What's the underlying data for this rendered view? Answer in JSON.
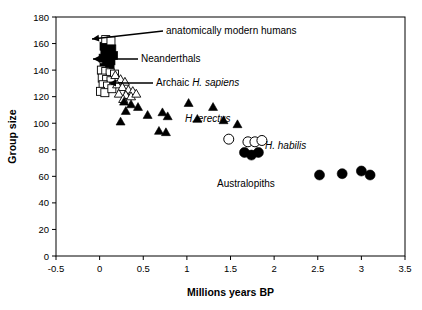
{
  "chart_data": {
    "type": "scatter",
    "title": "",
    "xlabel": "Millions years BP",
    "ylabel": "Group size",
    "xlim": [
      -0.5,
      3.5
    ],
    "ylim": [
      0,
      180
    ],
    "xticks": [
      "-0.5",
      "0",
      "0.5",
      "1",
      "1.5",
      "2",
      "2.5",
      "3",
      "3.5"
    ],
    "xtick_values": [
      -0.5,
      0,
      0.5,
      1,
      1.5,
      2,
      2.5,
      3,
      3.5
    ],
    "yticks": [
      "0",
      "20",
      "40",
      "60",
      "80",
      "100",
      "120",
      "140",
      "160",
      "180"
    ],
    "ytick_values": [
      0,
      20,
      40,
      60,
      80,
      100,
      120,
      140,
      160,
      180
    ],
    "grid": false,
    "legend_position": "none",
    "series": [
      {
        "name": "anatomically modern humans",
        "marker": "filled-square",
        "points": [
          [
            0.05,
            158
          ],
          [
            0.1,
            157
          ],
          [
            0.14,
            156
          ],
          [
            0.06,
            153
          ],
          [
            0.11,
            152
          ],
          [
            0.16,
            151
          ],
          [
            0.04,
            149
          ],
          [
            0.09,
            148
          ],
          [
            0.13,
            147
          ],
          [
            0.08,
            144
          ],
          [
            0.12,
            143
          ],
          [
            0.05,
            142
          ]
        ]
      },
      {
        "name": "open-squares",
        "marker": "open-square",
        "points": [
          [
            0.07,
            163
          ],
          [
            0.13,
            162
          ],
          [
            0.02,
            140
          ],
          [
            0.07,
            139
          ],
          [
            0.12,
            138
          ],
          [
            0.17,
            137
          ],
          [
            0.03,
            134
          ],
          [
            0.08,
            133
          ],
          [
            0.13,
            132
          ],
          [
            0.04,
            129
          ],
          [
            0.09,
            128
          ],
          [
            0.01,
            124
          ],
          [
            0.06,
            123
          ],
          [
            0.14,
            126
          ]
        ]
      },
      {
        "name": "Archaic H. sapiens",
        "marker": "open-triangle",
        "points": [
          [
            0.18,
            136
          ],
          [
            0.24,
            133
          ],
          [
            0.29,
            131
          ],
          [
            0.2,
            129
          ],
          [
            0.26,
            127
          ],
          [
            0.33,
            125
          ],
          [
            0.38,
            124
          ],
          [
            0.22,
            122
          ],
          [
            0.3,
            121
          ],
          [
            0.36,
            120
          ],
          [
            0.42,
            122
          ],
          [
            0.27,
            118
          ]
        ]
      },
      {
        "name": "H. erectus",
        "marker": "filled-triangle",
        "points": [
          [
            0.28,
            116
          ],
          [
            0.36,
            114
          ],
          [
            0.44,
            112
          ],
          [
            0.3,
            109
          ],
          [
            0.24,
            101
          ],
          [
            0.55,
            106
          ],
          [
            0.72,
            108
          ],
          [
            0.78,
            105
          ],
          [
            0.68,
            94
          ],
          [
            0.76,
            93
          ],
          [
            1.02,
            115
          ],
          [
            1.12,
            103
          ],
          [
            1.3,
            112
          ],
          [
            1.42,
            102
          ],
          [
            1.58,
            99
          ]
        ]
      },
      {
        "name": "H. habilis",
        "marker": "open-circle",
        "points": [
          [
            1.48,
            88
          ],
          [
            1.7,
            86
          ],
          [
            1.78,
            86
          ],
          [
            1.86,
            87
          ]
        ]
      },
      {
        "name": "Australopiths",
        "marker": "filled-circle",
        "points": [
          [
            1.66,
            78
          ],
          [
            1.74,
            76
          ],
          [
            1.82,
            78
          ],
          [
            2.52,
            61
          ],
          [
            2.78,
            62
          ],
          [
            3.0,
            64
          ],
          [
            3.1,
            61
          ]
        ]
      }
    ],
    "annotations": [
      {
        "text": "anatomically modern humans",
        "text_x": 166,
        "text_y": 34,
        "arrow_from_x": 163,
        "arrow_from_y": 31,
        "arrow_to_x": 92,
        "arrow_to_y": 39,
        "italic": false
      },
      {
        "text": "Neanderthals",
        "text_x": 141,
        "text_y": 62,
        "arrow_from_x": 138,
        "arrow_from_y": 59,
        "arrow_to_x": 93,
        "arrow_to_y": 59,
        "italic": false
      },
      {
        "text": "Archaic ",
        "text_italic": "H. sapiens",
        "text_x": 156,
        "text_y": 86,
        "arrow_from_x": 153,
        "arrow_from_y": 83,
        "arrow_to_x": 109,
        "arrow_to_y": 83,
        "italic": true
      },
      {
        "text": "H. erectus",
        "text_x": 185,
        "text_y": 122,
        "italic": true
      },
      {
        "text": "H. habilis",
        "text_x": 265,
        "text_y": 149,
        "italic": true
      },
      {
        "text": "Australopiths",
        "text_x": 217,
        "text_y": 187,
        "italic": false
      }
    ]
  }
}
